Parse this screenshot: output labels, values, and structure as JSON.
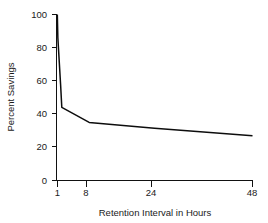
{
  "chart_data": {
    "type": "line",
    "title": "",
    "xlabel": "Retention Interval in Hours",
    "ylabel": "Percent Savings",
    "xlim": [
      0,
      48
    ],
    "ylim": [
      0,
      100
    ],
    "grid": false,
    "legend": null,
    "x_ticks": [
      1,
      8,
      24,
      48
    ],
    "x_tick_labels": [
      "1",
      "8",
      "24",
      "48"
    ],
    "y_ticks": [
      0,
      20,
      40,
      60,
      80,
      100
    ],
    "y_tick_labels": [
      "0",
      "20",
      "40",
      "60",
      "80",
      "100"
    ],
    "series": [
      {
        "name": "Percent Savings",
        "color": "#0d0d0d",
        "x": [
          0.2,
          0.33,
          1.0,
          1.3,
          8.0,
          24.0,
          48.0
        ],
        "values": [
          100,
          86,
          58,
          44,
          35,
          31.5,
          27
        ]
      }
    ]
  },
  "axes": {
    "y_axis_title": "Percent Savings",
    "x_axis_title": "Retention Interval in Hours",
    "y_tick_labels": [
      "100",
      "80",
      "60",
      "40",
      "20",
      "0"
    ],
    "x_tick_labels": [
      "1",
      "8",
      "24",
      "48"
    ]
  },
  "style": {
    "line_color": "#0d0d0d",
    "axis_color": "#111111",
    "text_color": "#1a1a1a",
    "background": "#ffffff"
  }
}
